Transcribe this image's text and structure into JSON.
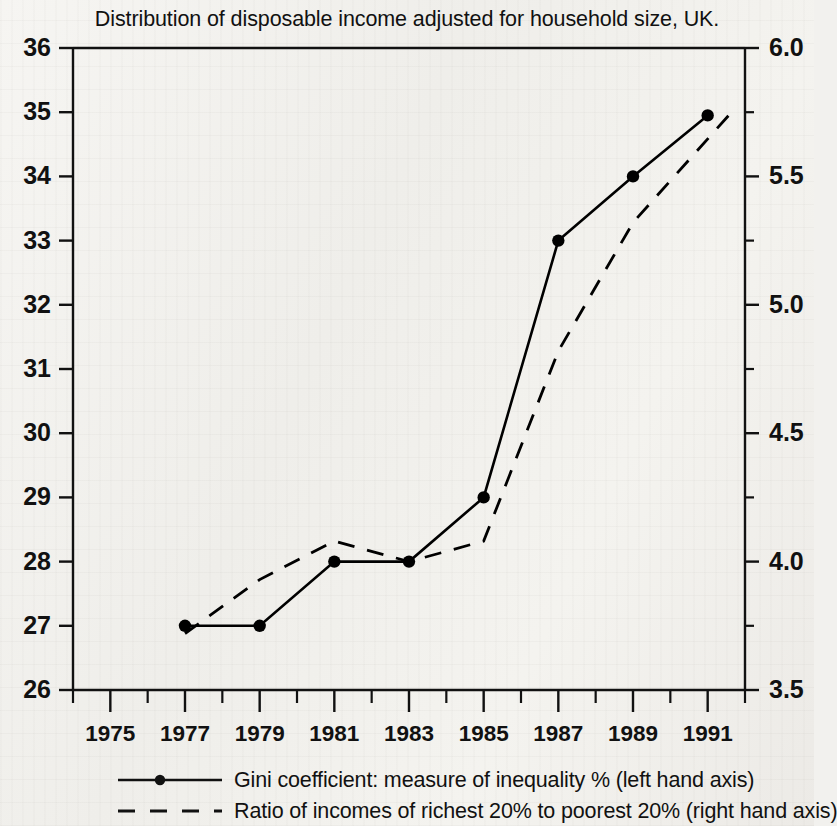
{
  "chart_data": {
    "type": "line",
    "title": "Distribution of disposable income adjusted for household size, UK.",
    "xlabel": "",
    "ylabel": "",
    "xlim": [
      1974,
      1992
    ],
    "x_major_ticks": [
      1975,
      1977,
      1979,
      1981,
      1983,
      1985,
      1987,
      1989,
      1991
    ],
    "x_tick_labels": [
      "1975",
      "1977",
      "1979",
      "1981",
      "1983",
      "1985",
      "1987",
      "1989",
      "1991"
    ],
    "x_minor_ticks": [
      1974,
      1976,
      1978,
      1980,
      1982,
      1984,
      1986,
      1988,
      1990,
      1992
    ],
    "grid": false,
    "legend_position": "below",
    "left_axis": {
      "label": "Gini coefficient: measure of inequality %",
      "ylim": [
        26,
        36
      ],
      "ticks": [
        26,
        27,
        28,
        29,
        30,
        31,
        32,
        33,
        34,
        35,
        36
      ],
      "tick_labels": [
        "26",
        "27",
        "28",
        "29",
        "30",
        "31",
        "32",
        "33",
        "34",
        "35",
        "36"
      ]
    },
    "right_axis": {
      "label": "Ratio of incomes of richest 20% to poorest 20%",
      "ylim": [
        3.5,
        6.0
      ],
      "ticks": [
        3.5,
        4.0,
        4.5,
        5.0,
        5.5,
        6.0
      ],
      "tick_labels": [
        "3.5",
        "4.0",
        "4.5",
        "5.0",
        "5.5",
        "6.0"
      ],
      "minor_ticks": [
        3.75,
        4.25,
        4.75,
        5.25,
        5.75
      ]
    },
    "series": [
      {
        "name": "gini",
        "legend": "Gini coefficient: measure of inequality % (left hand axis)",
        "axis": "left",
        "style": "solid",
        "marker": "circle",
        "color": "#000000",
        "x": [
          1977,
          1979,
          1981,
          1983,
          1985,
          1987,
          1989,
          1991
        ],
        "values": [
          27.0,
          27.0,
          28.0,
          28.0,
          29.0,
          33.0,
          34.0,
          34.95
        ]
      },
      {
        "name": "ratio",
        "legend": "Ratio of incomes of richest 20% to poorest 20% (right hand axis)",
        "axis": "right",
        "style": "dashed",
        "marker": "none",
        "color": "#000000",
        "x": [
          1977,
          1979,
          1981,
          1983,
          1985,
          1987,
          1989,
          1991.7
        ],
        "values": [
          3.72,
          3.93,
          4.08,
          4.0,
          4.08,
          4.82,
          5.32,
          5.76
        ]
      }
    ]
  },
  "legend": {
    "items": [
      {
        "label": "Gini coefficient: measure of inequality % (left hand axis)",
        "style": "solid",
        "marker": "circle"
      },
      {
        "label": "Ratio of incomes of richest 20% to poorest 20% (right hand axis)",
        "style": "dashed",
        "marker": "none"
      }
    ]
  }
}
